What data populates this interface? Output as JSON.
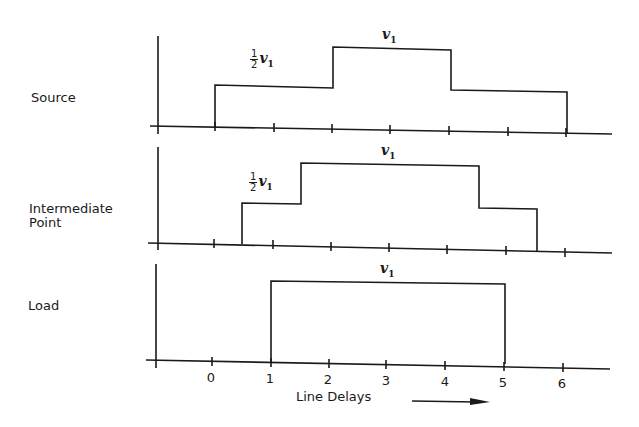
{
  "diagram": {
    "rows": [
      {
        "name": "Source",
        "label": "Source",
        "levels": [
          {
            "label_frac": "1/2",
            "label_num": "1",
            "label_den": "2",
            "label_var": "v",
            "label_sub": "1",
            "from": 0,
            "to": 2,
            "level": "half"
          },
          {
            "label_var": "v",
            "label_sub": "1",
            "from": 2,
            "to": 4,
            "level": "full"
          },
          {
            "from": 4,
            "to": 6,
            "level": "half"
          }
        ]
      },
      {
        "name": "Intermediate Point",
        "label_line1": "Intermediate",
        "label_line2": "Point",
        "levels": [
          {
            "label_num": "1",
            "label_den": "2",
            "label_var": "v",
            "label_sub": "1",
            "from": 0.5,
            "to": 1.5,
            "level": "half"
          },
          {
            "label_var": "v",
            "label_sub": "1",
            "from": 1.5,
            "to": 4.5,
            "level": "full"
          },
          {
            "from": 4.5,
            "to": 5.5,
            "level": "half"
          }
        ]
      },
      {
        "name": "Load",
        "label": "Load",
        "levels": [
          {
            "label_var": "v",
            "label_sub": "1",
            "from": 1,
            "to": 5,
            "level": "full"
          }
        ]
      }
    ],
    "x_axis": {
      "ticks": [
        "0",
        "1",
        "2",
        "3",
        "4",
        "5",
        "6"
      ],
      "label": "Line Delays",
      "arrow": "right-arrow"
    }
  }
}
